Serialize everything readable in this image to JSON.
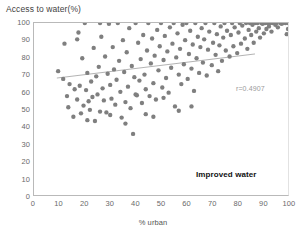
{
  "chart_data": {
    "type": "scatter",
    "title": "",
    "xlabel": "% urban",
    "ylabel": "Access to water(%)",
    "xlim": [
      0,
      100
    ],
    "ylim": [
      0,
      100
    ],
    "xticks": [
      0,
      10,
      20,
      30,
      40,
      50,
      60,
      70,
      80,
      90,
      100
    ],
    "yticks": [
      0,
      10,
      20,
      30,
      40,
      50,
      60,
      70,
      80,
      90,
      100
    ],
    "grid": false,
    "legend_position": "none",
    "marker_color": "#7f7f7f",
    "marker_size": 4.4,
    "trendline": {
      "color": "#aaaaaa",
      "x_start": 9,
      "y_start": 68,
      "x_end": 87,
      "y_end": 82
    },
    "annotations": [
      {
        "name": "correlation",
        "text": "r=0.4907"
      },
      {
        "name": "series-name",
        "text": "Improved water"
      }
    ],
    "points": [
      [
        9.5,
        72.0
      ],
      [
        11.5,
        67.5
      ],
      [
        12.0,
        88.0
      ],
      [
        13.0,
        57.5
      ],
      [
        14.0,
        64.5
      ],
      [
        15.5,
        45.5
      ],
      [
        16.0,
        61.5
      ],
      [
        17.0,
        90.5
      ],
      [
        17.5,
        94.5
      ],
      [
        18.0,
        63.5
      ],
      [
        18.5,
        47.5
      ],
      [
        19.0,
        79.5
      ],
      [
        19.5,
        52.0
      ],
      [
        20.0,
        100.0
      ],
      [
        20.5,
        61.0
      ],
      [
        21.0,
        71.0
      ],
      [
        21.5,
        54.5
      ],
      [
        22.0,
        49.5
      ],
      [
        22.5,
        66.0
      ],
      [
        23.0,
        57.0
      ],
      [
        23.5,
        85.5
      ],
      [
        24.0,
        43.0
      ],
      [
        24.5,
        69.0
      ],
      [
        25.0,
        58.5
      ],
      [
        25.5,
        74.5
      ],
      [
        26.0,
        100.0
      ],
      [
        26.5,
        92.0
      ],
      [
        27.0,
        62.0
      ],
      [
        27.5,
        55.0
      ],
      [
        28.0,
        80.5
      ],
      [
        28.5,
        48.0
      ],
      [
        29.0,
        70.5
      ],
      [
        29.5,
        99.5
      ],
      [
        30.0,
        64.0
      ],
      [
        30.5,
        56.0
      ],
      [
        31.0,
        86.0
      ],
      [
        31.5,
        73.0
      ],
      [
        32.0,
        52.5
      ],
      [
        32.5,
        67.0
      ],
      [
        33.0,
        100.0
      ],
      [
        33.5,
        78.0
      ],
      [
        34.0,
        60.0
      ],
      [
        34.5,
        45.0
      ],
      [
        35.0,
        90.0
      ],
      [
        35.5,
        71.5
      ],
      [
        36.0,
        54.0
      ],
      [
        36.5,
        83.0
      ],
      [
        37.0,
        63.0
      ],
      [
        37.5,
        97.0
      ],
      [
        38.0,
        50.5
      ],
      [
        38.5,
        75.0
      ],
      [
        39.0,
        35.5
      ],
      [
        39.5,
        68.5
      ],
      [
        40.0,
        100.0
      ],
      [
        40.5,
        58.0
      ],
      [
        41.0,
        88.5
      ],
      [
        41.5,
        66.5
      ],
      [
        42.0,
        79.0
      ],
      [
        42.5,
        53.5
      ],
      [
        43.0,
        93.0
      ],
      [
        43.5,
        70.0
      ],
      [
        44.0,
        61.5
      ],
      [
        44.5,
        84.0
      ],
      [
        45.0,
        100.0
      ],
      [
        45.5,
        57.5
      ],
      [
        46.0,
        76.5
      ],
      [
        46.5,
        91.0
      ],
      [
        47.0,
        65.0
      ],
      [
        47.5,
        81.0
      ],
      [
        48.0,
        55.5
      ],
      [
        48.5,
        96.0
      ],
      [
        49.0,
        72.5
      ],
      [
        49.5,
        86.5
      ],
      [
        50.0,
        100.0
      ],
      [
        50.5,
        62.5
      ],
      [
        51.0,
        78.5
      ],
      [
        51.5,
        92.5
      ],
      [
        52.0,
        68.0
      ],
      [
        52.5,
        83.5
      ],
      [
        53.0,
        59.5
      ],
      [
        53.5,
        97.5
      ],
      [
        54.0,
        74.0
      ],
      [
        54.5,
        88.0
      ],
      [
        55.0,
        100.0
      ],
      [
        55.5,
        51.5
      ],
      [
        56.0,
        80.0
      ],
      [
        56.5,
        94.0
      ],
      [
        57.0,
        70.0
      ],
      [
        57.5,
        85.0
      ],
      [
        58.0,
        64.5
      ],
      [
        58.5,
        99.0
      ],
      [
        59.0,
        76.0
      ],
      [
        59.5,
        90.0
      ],
      [
        60.0,
        100.0
      ],
      [
        60.5,
        67.5
      ],
      [
        61.0,
        82.0
      ],
      [
        61.5,
        95.5
      ],
      [
        62.0,
        73.5
      ],
      [
        62.5,
        87.5
      ],
      [
        63.0,
        60.5
      ],
      [
        63.5,
        100.0
      ],
      [
        64.0,
        79.5
      ],
      [
        64.5,
        92.0
      ],
      [
        65.0,
        71.0
      ],
      [
        65.5,
        86.0
      ],
      [
        66.0,
        97.0
      ],
      [
        66.5,
        77.0
      ],
      [
        67.0,
        90.5
      ],
      [
        67.5,
        100.0
      ],
      [
        68.0,
        69.5
      ],
      [
        68.5,
        84.5
      ],
      [
        69.0,
        95.0
      ],
      [
        70.0,
        75.5
      ],
      [
        70.5,
        88.5
      ],
      [
        71.0,
        100.0
      ],
      [
        71.5,
        81.5
      ],
      [
        72.0,
        93.5
      ],
      [
        72.5,
        72.0
      ],
      [
        73.0,
        87.0
      ],
      [
        73.5,
        98.0
      ],
      [
        74.0,
        78.0
      ],
      [
        74.5,
        91.5
      ],
      [
        75.0,
        100.0
      ],
      [
        75.5,
        84.0
      ],
      [
        76.0,
        95.5
      ],
      [
        77.0,
        80.5
      ],
      [
        77.5,
        93.0
      ],
      [
        78.0,
        100.0
      ],
      [
        78.5,
        86.5
      ],
      [
        79.0,
        97.5
      ],
      [
        80.0,
        82.5
      ],
      [
        80.5,
        94.5
      ],
      [
        81.0,
        100.0
      ],
      [
        81.5,
        88.0
      ],
      [
        82.0,
        98.5
      ],
      [
        83.0,
        91.0
      ],
      [
        83.5,
        100.0
      ],
      [
        84.0,
        85.0
      ],
      [
        84.5,
        96.0
      ],
      [
        85.0,
        100.0
      ],
      [
        85.5,
        93.0
      ],
      [
        86.0,
        99.0
      ],
      [
        86.5,
        88.5
      ],
      [
        87.0,
        100.0
      ],
      [
        87.5,
        95.0
      ],
      [
        88.0,
        100.0
      ],
      [
        88.5,
        97.0
      ],
      [
        89.0,
        91.5
      ],
      [
        89.5,
        100.0
      ],
      [
        90.0,
        99.5
      ],
      [
        90.5,
        94.0
      ],
      [
        91.0,
        100.0
      ],
      [
        91.5,
        96.5
      ],
      [
        92.0,
        100.0
      ],
      [
        92.5,
        98.0
      ],
      [
        93.0,
        100.0
      ],
      [
        93.5,
        95.0
      ],
      [
        94.0,
        100.0
      ],
      [
        95.0,
        99.0
      ],
      [
        95.5,
        100.0
      ],
      [
        96.0,
        97.5
      ],
      [
        97.0,
        100.0
      ],
      [
        97.5,
        99.5
      ],
      [
        98.0,
        100.0
      ],
      [
        99.0,
        100.0
      ],
      [
        100.0,
        100.0
      ],
      [
        100.0,
        96.5
      ],
      [
        99.5,
        93.5
      ],
      [
        62.0,
        51.5
      ],
      [
        57.0,
        49.0
      ],
      [
        47.0,
        45.5
      ],
      [
        51.0,
        56.5
      ],
      [
        44.0,
        47.0
      ],
      [
        40.0,
        58.5
      ],
      [
        36.0,
        41.5
      ],
      [
        30.0,
        46.5
      ],
      [
        26.0,
        48.5
      ],
      [
        21.0,
        43.5
      ],
      [
        17.0,
        55.5
      ],
      [
        13.5,
        51.0
      ]
    ]
  }
}
